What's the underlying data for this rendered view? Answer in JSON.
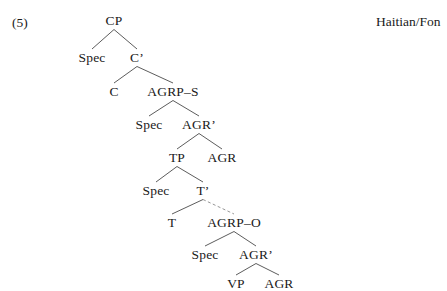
{
  "figure": {
    "example_number": "(5)",
    "language_label": "Haitian/Fon",
    "tree": {
      "nodes": [
        {
          "id": "cp",
          "label": "CP",
          "x": 114,
          "y": 14
        },
        {
          "id": "spec-cp",
          "label": "Spec",
          "x": 92,
          "y": 51
        },
        {
          "id": "cbar",
          "label": "C’",
          "x": 137,
          "y": 51
        },
        {
          "id": "c",
          "label": "C",
          "x": 114,
          "y": 85
        },
        {
          "id": "agrp-s",
          "label": "AGRP–S",
          "x": 173,
          "y": 85
        },
        {
          "id": "spec-agrs",
          "label": "Spec",
          "x": 149,
          "y": 118
        },
        {
          "id": "agr-bar-s",
          "label": "AGR’",
          "x": 199,
          "y": 118
        },
        {
          "id": "tp",
          "label": "TP",
          "x": 177,
          "y": 151
        },
        {
          "id": "agr-s",
          "label": "AGR",
          "x": 222,
          "y": 151
        },
        {
          "id": "spec-tp",
          "label": "Spec",
          "x": 156,
          "y": 184
        },
        {
          "id": "tbar",
          "label": "T’",
          "x": 203,
          "y": 184
        },
        {
          "id": "t",
          "label": "T",
          "x": 172,
          "y": 216
        },
        {
          "id": "agrp-o",
          "label": "AGRP–O",
          "x": 234,
          "y": 216
        },
        {
          "id": "spec-agro",
          "label": "Spec",
          "x": 205,
          "y": 248
        },
        {
          "id": "agr-bar-o",
          "label": "AGR’",
          "x": 256,
          "y": 248
        },
        {
          "id": "vp",
          "label": "VP",
          "x": 236,
          "y": 277
        },
        {
          "id": "agr-o",
          "label": "AGR",
          "x": 279,
          "y": 277
        }
      ],
      "branches": [
        {
          "from": "cp",
          "to": "spec-cp",
          "style": "solid"
        },
        {
          "from": "cp",
          "to": "cbar",
          "style": "solid"
        },
        {
          "from": "cbar",
          "to": "c",
          "style": "solid"
        },
        {
          "from": "cbar",
          "to": "agrp-s",
          "style": "solid"
        },
        {
          "from": "agrp-s",
          "to": "spec-agrs",
          "style": "solid"
        },
        {
          "from": "agrp-s",
          "to": "agr-bar-s",
          "style": "solid"
        },
        {
          "from": "agr-bar-s",
          "to": "tp",
          "style": "solid"
        },
        {
          "from": "agr-bar-s",
          "to": "agr-s",
          "style": "solid"
        },
        {
          "from": "tp",
          "to": "spec-tp",
          "style": "solid"
        },
        {
          "from": "tp",
          "to": "tbar",
          "style": "solid"
        },
        {
          "from": "tbar",
          "to": "t",
          "style": "solid"
        },
        {
          "from": "tbar",
          "to": "agrp-o",
          "style": "dashed"
        },
        {
          "from": "agrp-o",
          "to": "spec-agro",
          "style": "solid"
        },
        {
          "from": "agrp-o",
          "to": "agr-bar-o",
          "style": "solid"
        },
        {
          "from": "agr-bar-o",
          "to": "vp",
          "style": "solid"
        },
        {
          "from": "agr-bar-o",
          "to": "agr-o",
          "style": "solid"
        }
      ]
    }
  }
}
